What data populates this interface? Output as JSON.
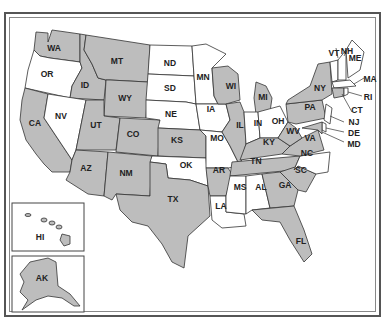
{
  "map": {
    "title": "United States map",
    "colors": {
      "shaded": "#bdbdbd",
      "unshaded": "#ffffff",
      "border": "#333333"
    },
    "states": [
      {
        "abbr": "WA",
        "shaded": true
      },
      {
        "abbr": "OR",
        "shaded": false
      },
      {
        "abbr": "CA",
        "shaded": true
      },
      {
        "abbr": "ID",
        "shaded": true
      },
      {
        "abbr": "NV",
        "shaded": false
      },
      {
        "abbr": "MT",
        "shaded": true
      },
      {
        "abbr": "WY",
        "shaded": true
      },
      {
        "abbr": "UT",
        "shaded": true
      },
      {
        "abbr": "AZ",
        "shaded": true
      },
      {
        "abbr": "CO",
        "shaded": true
      },
      {
        "abbr": "NM",
        "shaded": true
      },
      {
        "abbr": "ND",
        "shaded": false
      },
      {
        "abbr": "SD",
        "shaded": false
      },
      {
        "abbr": "NE",
        "shaded": false
      },
      {
        "abbr": "KS",
        "shaded": true
      },
      {
        "abbr": "OK",
        "shaded": false
      },
      {
        "abbr": "TX",
        "shaded": true
      },
      {
        "abbr": "MN",
        "shaded": false
      },
      {
        "abbr": "IA",
        "shaded": false
      },
      {
        "abbr": "MO",
        "shaded": false
      },
      {
        "abbr": "AR",
        "shaded": true
      },
      {
        "abbr": "LA",
        "shaded": false
      },
      {
        "abbr": "WI",
        "shaded": true
      },
      {
        "abbr": "IL",
        "shaded": true
      },
      {
        "abbr": "MI",
        "shaded": true
      },
      {
        "abbr": "IN",
        "shaded": false
      },
      {
        "abbr": "OH",
        "shaded": false
      },
      {
        "abbr": "KY",
        "shaded": true
      },
      {
        "abbr": "TN",
        "shaded": true
      },
      {
        "abbr": "MS",
        "shaded": false
      },
      {
        "abbr": "AL",
        "shaded": false
      },
      {
        "abbr": "GA",
        "shaded": true
      },
      {
        "abbr": "FL",
        "shaded": true
      },
      {
        "abbr": "SC",
        "shaded": true
      },
      {
        "abbr": "NC",
        "shaded": false
      },
      {
        "abbr": "VA",
        "shaded": true
      },
      {
        "abbr": "WV",
        "shaded": true
      },
      {
        "abbr": "PA",
        "shaded": true
      },
      {
        "abbr": "NY",
        "shaded": true
      },
      {
        "abbr": "VT",
        "shaded": false
      },
      {
        "abbr": "NH",
        "shaded": false
      },
      {
        "abbr": "ME",
        "shaded": false
      },
      {
        "abbr": "MA",
        "shaded": false
      },
      {
        "abbr": "RI",
        "shaded": false
      },
      {
        "abbr": "CT",
        "shaded": true
      },
      {
        "abbr": "NJ",
        "shaded": false
      },
      {
        "abbr": "DE",
        "shaded": false
      },
      {
        "abbr": "MD",
        "shaded": true
      },
      {
        "abbr": "HI",
        "shaded": true
      },
      {
        "abbr": "AK",
        "shaded": true
      }
    ],
    "labels": {
      "WA": "WA",
      "OR": "OR",
      "CA": "CA",
      "ID": "ID",
      "NV": "NV",
      "MT": "MT",
      "WY": "WY",
      "UT": "UT",
      "AZ": "AZ",
      "CO": "CO",
      "NM": "NM",
      "ND": "ND",
      "SD": "SD",
      "NE": "NE",
      "KS": "KS",
      "OK": "OK",
      "TX": "TX",
      "MN": "MN",
      "IA": "IA",
      "MO": "MO",
      "AR": "AR",
      "LA": "LA",
      "WI": "WI",
      "IL": "IL",
      "MI": "MI",
      "IN": "IN",
      "OH": "OH",
      "KY": "KY",
      "TN": "TN",
      "MS": "MS",
      "AL": "AL",
      "GA": "GA",
      "FL": "FL",
      "SC": "SC",
      "NC": "NC",
      "VA": "VA",
      "WV": "WV",
      "PA": "PA",
      "NY": "NY",
      "VT": "VT",
      "NH": "NH",
      "ME": "ME",
      "MA": "MA",
      "RI": "RI",
      "CT": "CT",
      "NJ": "NJ",
      "DE": "DE",
      "MD": "MD",
      "HI": "HI",
      "AK": "AK"
    }
  }
}
